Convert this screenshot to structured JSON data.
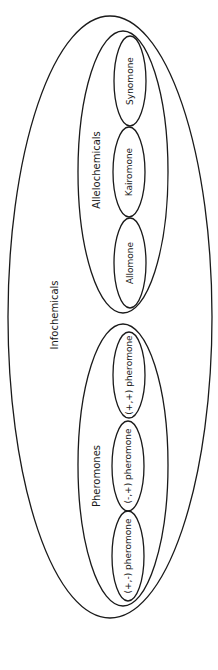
{
  "diagram": {
    "type": "nested-ellipse-venn",
    "orientation": "rotated-90-ccw",
    "line_color": "#1a1a1a",
    "background_color": "#ffffff",
    "root": {
      "label": "Infochemicals",
      "children": [
        {
          "label": "Allelochemicals",
          "children": [
            {
              "label": "Synomone"
            },
            {
              "label": "Kairomone"
            },
            {
              "label": "Allomone"
            }
          ]
        },
        {
          "label": "Pheromones",
          "children": [
            {
              "label": "(+,+) pheromone"
            },
            {
              "label": "(-,+) pheromone"
            },
            {
              "label": "(+,-) pheromone"
            }
          ]
        }
      ]
    }
  }
}
